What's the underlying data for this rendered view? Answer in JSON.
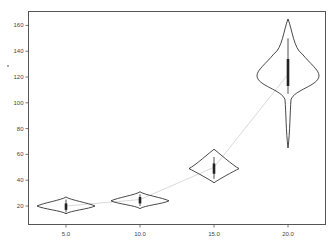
{
  "chart_data": {
    "type": "violin",
    "title": "",
    "xlabel": "",
    "ylabel": "",
    "categories": [
      "5.0",
      "10.0",
      "15.0",
      "20.0"
    ],
    "x_positions": [
      5.0,
      10.0,
      15.0,
      20.0
    ],
    "yticks": [
      20,
      40,
      60,
      80,
      100,
      120,
      140,
      160
    ],
    "ylim": [
      5,
      170
    ],
    "grid": false,
    "legend": null,
    "violins": [
      {
        "x": 5.0,
        "min": 14,
        "max": 27,
        "mode": 20,
        "q1": 17,
        "q3": 22,
        "whisker_low": 15,
        "whisker_high": 25,
        "median": 20
      },
      {
        "x": 10.0,
        "min": 18,
        "max": 31,
        "mode": 24,
        "q1": 22,
        "q3": 27,
        "whisker_low": 20,
        "whisker_high": 29,
        "median": 25
      },
      {
        "x": 15.0,
        "min": 38,
        "max": 64,
        "mode": 49,
        "q1": 45,
        "q3": 53,
        "whisker_low": 41,
        "whisker_high": 58,
        "median": 50
      },
      {
        "x": 20.0,
        "min": 65,
        "max": 165,
        "mode": 121,
        "q1": 113,
        "q3": 134,
        "whisker_low": 107,
        "whisker_high": 150,
        "median": 122
      }
    ],
    "trend_line": {
      "x": [
        5.0,
        10.0,
        15.0,
        20.0
      ],
      "y": [
        20,
        25,
        50,
        122
      ],
      "color": "#c8c8c8"
    },
    "colors": {
      "outline": "#333333",
      "box": "#222222",
      "frame": "#555555",
      "trend": "#c8c8c8"
    }
  },
  "marker_dot": {
    "x": 8,
    "y": 66
  }
}
